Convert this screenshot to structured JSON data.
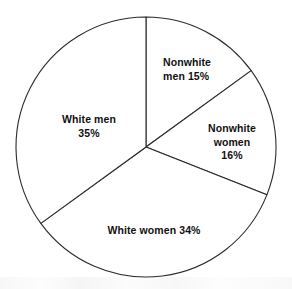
{
  "chart_data": {
    "type": "pie",
    "title": "",
    "subtitle": "",
    "xlabel": "",
    "ylabel": "",
    "legend": "none",
    "grid": false,
    "units": "percent",
    "total": 100,
    "start_angle_deg": 0,
    "direction": "clockwise",
    "categories": [
      "Nonwhite men",
      "Nonwhite women",
      "White women",
      "White men"
    ],
    "values": [
      15,
      16,
      34,
      35
    ],
    "slices": [
      {
        "name": "nonwhite-men",
        "category": "Nonwhite men",
        "value": 15,
        "label": "Nonwhite\nmen 15%",
        "start_deg": 0,
        "end_deg": 54,
        "label_x": 163,
        "label_y": 69,
        "align": "left"
      },
      {
        "name": "nonwhite-women",
        "category": "Nonwhite women",
        "value": 16,
        "label": "Nonwhite\nwomen 16%",
        "start_deg": 54,
        "end_deg": 111.6,
        "label_x": 232,
        "label_y": 142,
        "align": "center"
      },
      {
        "name": "white-women",
        "category": "White women",
        "value": 34,
        "label": "White women 34%",
        "start_deg": 111.6,
        "end_deg": 234,
        "label_x": 154,
        "label_y": 231,
        "align": "center"
      },
      {
        "name": "white-men",
        "category": "White men",
        "value": 35,
        "label": "White men\n35%",
        "start_deg": 234,
        "end_deg": 360,
        "label_x": 89,
        "label_y": 126,
        "align": "center"
      }
    ],
    "geometry": {
      "center_x": 146,
      "center_y": 147,
      "radius": 130
    },
    "colors": {
      "slice_fill": "#ffffff",
      "slice_stroke": "#2b2b2b",
      "label_text": "#111111",
      "background": "#ffffff"
    }
  }
}
